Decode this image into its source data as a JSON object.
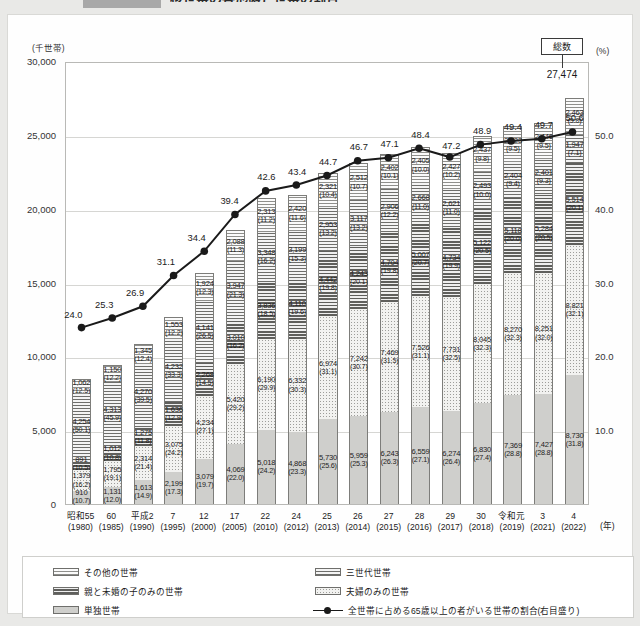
{
  "header": {
    "tag_label": "",
    "title": "核世帯の各形態と世帯の割合"
  },
  "axes": {
    "y_left_unit": "(千世帯)",
    "y_right_unit": "(%)",
    "x_unit": "(年)",
    "y_left_ticks": [
      "30,000",
      "25,000",
      "20,000",
      "15,000",
      "10,000",
      "5,000",
      "0"
    ],
    "y_right_ticks": [
      "",
      "50.0",
      "",
      "40.0",
      "",
      "30.0",
      "",
      "20.0",
      "",
      "10.0",
      ""
    ],
    "y_left_max": 30000,
    "y_right_max": 60.0
  },
  "total_callout": {
    "box_label": "総数",
    "value": "27,474"
  },
  "legend": {
    "items": [
      {
        "key": "other",
        "label": "その他の世帯"
      },
      {
        "key": "parent",
        "label": "親と未婚の子のみの世帯"
      },
      {
        "key": "single",
        "label": "単独世帯"
      },
      {
        "key": "three",
        "label": "三世代世帯"
      },
      {
        "key": "couple",
        "label": "夫婦のみの世帯"
      }
    ],
    "line_label": "全世帯に占める65歳以上の者がいる世帯の割合(右目盛り)"
  },
  "chart_data": {
    "type": "bar",
    "title": "核世帯の各形態と世帯の割合",
    "xlabel": "(年)",
    "ylabel": "(千世帯)",
    "ylabel_right": "(%)",
    "ylim": [
      0,
      30000
    ],
    "ylim_right": [
      0,
      60.0
    ],
    "grid": true,
    "legend_position": "bottom",
    "stacked": true,
    "categories": [
      "昭和55\n(1980)",
      "60\n(1985)",
      "平成2\n(1990)",
      "7\n(1995)",
      "12\n(2000)",
      "17\n(2005)",
      "22\n(2010)",
      "24\n(2012)",
      "25\n(2013)",
      "26\n(2014)",
      "27\n(2015)",
      "28\n(2016)",
      "29\n(2017)",
      "30\n(2018)",
      "令和元\n(2019)",
      "3\n(2021)",
      "4\n(2022)"
    ],
    "series": [
      {
        "name": "その他の世帯",
        "key": "other",
        "values": [
          1062,
          1150,
          1345,
          1553,
          1924,
          2088,
          2313,
          2420,
          2321,
          2512,
          2402,
          2405,
          2427,
          2437,
          2423,
          2446,
          2463
        ],
        "pct": [
          12.5,
          12.2,
          12.4,
          12.2,
          12.3,
          11.3,
          11.2,
          11.6,
          10.4,
          10.7,
          10.1,
          10.0,
          10.2,
          9.8,
          9.5,
          9.5,
          9.0
        ]
      },
      {
        "name": "三世代世帯",
        "key": "three",
        "values": [
          4254,
          4313,
          4270,
          4232,
          4141,
          3947,
          3348,
          3199,
          2953,
          3117,
          2906,
          2668,
          2621,
          2493,
          2404,
          2401,
          1947
        ],
        "pct": [
          50.1,
          45.9,
          39.5,
          33.3,
          26.5,
          21.3,
          16.2,
          15.3,
          13.2,
          13.2,
          12.2,
          11.0,
          11.0,
          10.0,
          9.4,
          9.3,
          7.1
        ]
      },
      {
        "name": "親と未婚の子のみの世帯",
        "key": "parent",
        "values": [
          891,
          1012,
          1275,
          1636,
          2268,
          3010,
          3836,
          4110,
          4442,
          4243,
          4704,
          5007,
          4734,
          5122,
          5118,
          5284,
          5514
        ],
        "pct": [
          10.5,
          10.8,
          11.8,
          12.9,
          14.5,
          16.2,
          18.5,
          19.6,
          19.8,
          20.1,
          19.8,
          20.7,
          19.9,
          20.5,
          20.0,
          20.5,
          20.1
        ]
      },
      {
        "name": "夫婦のみの世帯",
        "key": "couple",
        "values": [
          1379,
          1795,
          2314,
          3075,
          4234,
          5420,
          6190,
          6332,
          6974,
          7242,
          7469,
          7526,
          7731,
          8045,
          8270,
          8251,
          8821
        ],
        "pct": [
          16.2,
          19.1,
          21.4,
          24.2,
          27.1,
          29.2,
          29.9,
          30.3,
          31.1,
          30.7,
          31.5,
          31.1,
          32.5,
          32.3,
          32.3,
          32.0,
          32.1
        ]
      },
      {
        "name": "単独世帯",
        "key": "single",
        "values": [
          910,
          1131,
          1613,
          2199,
          3079,
          4069,
          5018,
          4868,
          5730,
          5959,
          6243,
          6559,
          6274,
          6830,
          7369,
          7427,
          8730
        ],
        "pct": [
          10.7,
          12.0,
          14.9,
          17.3,
          19.7,
          22.0,
          24.2,
          23.3,
          25.6,
          25.3,
          26.3,
          27.1,
          26.4,
          27.4,
          28.8,
          28.8,
          31.8
        ]
      }
    ],
    "line_series": {
      "name": "全世帯に占める65歳以上の者がいる世帯の割合(右目盛り)",
      "axis": "right",
      "values": [
        24.0,
        25.3,
        26.9,
        31.1,
        34.4,
        39.4,
        42.6,
        43.4,
        44.7,
        46.7,
        47.1,
        48.4,
        47.2,
        48.9,
        49.4,
        49.7,
        50.6
      ]
    },
    "totals": [
      8496,
      9401,
      10817,
      12695,
      15647,
      18534,
      20705,
      20929,
      22420,
      23073,
      23724,
      24165,
      23787,
      24927,
      25584,
      25809,
      27474
    ]
  },
  "footnote": ""
}
